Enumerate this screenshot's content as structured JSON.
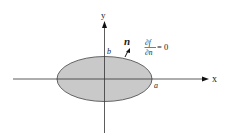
{
  "diagram": {
    "type": "ellipse-domain-with-axes",
    "axes": {
      "x_label": "x",
      "y_label": "y"
    },
    "ellipse": {
      "fill_color": "#c8c8c8",
      "stroke_color": "#444444",
      "semi_axis_x_label": "a",
      "semi_axis_y_label": "b"
    },
    "normal_vector": {
      "label": "n"
    },
    "boundary_condition": {
      "numerator": "∂f",
      "denominator": "∂n",
      "equals": "= 0"
    }
  }
}
